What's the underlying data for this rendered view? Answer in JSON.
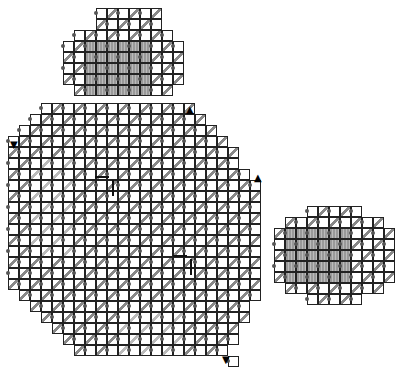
{
  "board": {
    "cell_size": 11,
    "colors": {
      "grid": "#222222",
      "hatch": "#888888",
      "hatch_light": "#bbbbbb",
      "fill": "#999999",
      "dot": "#555555"
    },
    "regions": [
      {
        "name": "top-circle",
        "origin": [
          63,
          8
        ],
        "rows": [
          [
            3,
            8
          ],
          [
            3,
            8
          ],
          [
            1,
            9
          ],
          [
            0,
            10
          ],
          [
            0,
            10
          ],
          [
            0,
            10
          ],
          [
            0,
            10
          ],
          [
            1,
            9
          ]
        ],
        "fill_rows": [
          [
            2,
            7
          ],
          [
            2,
            7
          ],
          [
            2,
            7
          ],
          [
            2,
            7
          ],
          [
            2,
            7
          ]
        ],
        "fill_start_row": 3
      },
      {
        "name": "main-blob",
        "origin": [
          8,
          103
        ],
        "rows": [
          [
            3,
            16
          ],
          [
            2,
            17
          ],
          [
            1,
            18
          ],
          [
            0,
            19
          ],
          [
            0,
            20
          ],
          [
            0,
            20
          ],
          [
            0,
            21
          ],
          [
            0,
            22
          ],
          [
            0,
            22
          ],
          [
            0,
            22
          ],
          [
            0,
            22
          ],
          [
            0,
            22
          ],
          [
            0,
            22
          ],
          [
            0,
            22
          ],
          [
            0,
            22
          ],
          [
            0,
            22
          ],
          [
            0,
            22
          ],
          [
            1,
            22
          ],
          [
            2,
            21
          ],
          [
            3,
            21
          ],
          [
            4,
            20
          ],
          [
            5,
            20
          ],
          [
            6,
            19
          ],
          [
            20,
            20
          ]
        ],
        "fill_rows": [],
        "fill_start_row": 0
      },
      {
        "name": "right-circle",
        "origin": [
          274,
          206
        ],
        "rows": [
          [
            3,
            7
          ],
          [
            1,
            9
          ],
          [
            0,
            10
          ],
          [
            0,
            10
          ],
          [
            0,
            10
          ],
          [
            0,
            10
          ],
          [
            0,
            10
          ],
          [
            1,
            9
          ],
          [
            3,
            7
          ]
        ],
        "fill_rows": [
          [
            1,
            6
          ],
          [
            1,
            6
          ],
          [
            1,
            6
          ],
          [
            1,
            6
          ],
          [
            1,
            6
          ]
        ],
        "fill_start_row": 2
      }
    ],
    "markers": [
      {
        "symbol": "▼",
        "x": 10,
        "y": 140,
        "name": "down-triangle-marker-left"
      },
      {
        "symbol": "▲",
        "x": 186,
        "y": 105,
        "name": "up-triangle-marker-top"
      },
      {
        "symbol": "▲",
        "x": 254,
        "y": 173,
        "name": "up-triangle-marker-right"
      },
      {
        "symbol": "▼",
        "x": 222,
        "y": 355,
        "name": "down-triangle-marker-bottom"
      }
    ],
    "pieces": [
      {
        "name": "l-piece-upper",
        "x": 95,
        "y": 176
      },
      {
        "name": "l-piece-lower",
        "x": 173,
        "y": 255
      }
    ]
  }
}
